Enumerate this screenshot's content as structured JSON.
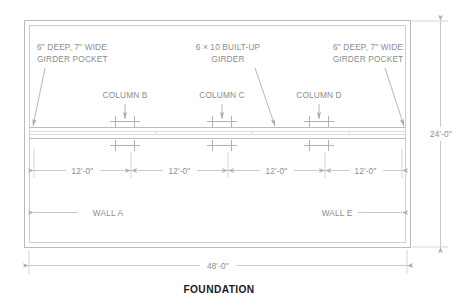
{
  "drawing": {
    "title": "FOUNDATION",
    "notes": [
      {
        "id": "girder-pocket-left",
        "line1": "6\" DEEP, 7\" WIDE",
        "line2": "GIRDER POCKET"
      },
      {
        "id": "built-up-girder",
        "line1": "6 × 10 BUILT-UP",
        "line2": "GIRDER"
      },
      {
        "id": "girder-pocket-right",
        "line1": "6\" DEEP, 7\" WIDE",
        "line2": "GIRDER POCKET"
      }
    ],
    "columns": [
      {
        "id": "column-b",
        "label": "COLUMN B"
      },
      {
        "id": "column-c",
        "label": "COLUMN C"
      },
      {
        "id": "column-d",
        "label": "COLUMN D"
      }
    ],
    "walls": [
      {
        "id": "wall-a",
        "label": "WALL A"
      },
      {
        "id": "wall-e",
        "label": "WALL E"
      }
    ],
    "dimensions": {
      "bays": [
        "12'-0\"",
        "12'-0\"",
        "12'-0\"",
        "12'-0\""
      ],
      "overall_width": "48'-0\"",
      "overall_height": "24'-0\""
    },
    "colors": {
      "line": "#b9b9b9",
      "text": "#8d8d8d",
      "title": "#1b1b1b",
      "background": "#ffffff"
    }
  }
}
